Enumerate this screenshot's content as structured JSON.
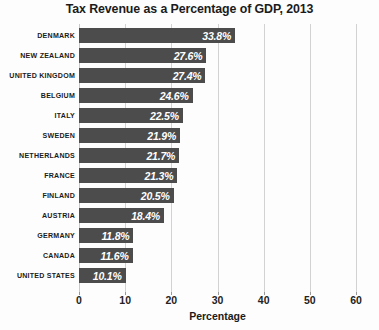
{
  "chart_data": {
    "type": "bar",
    "orientation": "horizontal",
    "title": "Tax Revenue as a Percentage of GDP, 2013",
    "xlabel": "Percentage",
    "ylabel": "",
    "categories": [
      "DENMARK",
      "NEW ZEALAND",
      "UNITED KINGDOM",
      "BELGIUM",
      "ITALY",
      "SWEDEN",
      "NETHERLANDS",
      "FRANCE",
      "FINLAND",
      "AUSTRIA",
      "GERMANY",
      "CANADA",
      "UNITED STATES"
    ],
    "values": [
      33.8,
      27.6,
      27.4,
      24.6,
      22.5,
      21.9,
      21.7,
      21.3,
      20.5,
      18.4,
      11.8,
      11.6,
      10.1
    ],
    "value_labels": [
      "33.8%",
      "27.6%",
      "27.4%",
      "24.6%",
      "22.5%",
      "21.9%",
      "21.7%",
      "21.3%",
      "20.5%",
      "18.4%",
      "11.8%",
      "11.6%",
      "10.1%"
    ],
    "xlim": [
      0,
      60
    ],
    "xticks": [
      0,
      10,
      20,
      30,
      40,
      50,
      60
    ],
    "xtick_labels": [
      "0",
      "10",
      "20",
      "30",
      "40",
      "50",
      "60"
    ],
    "grid": true,
    "grid_axis": "x",
    "legend": false,
    "bar_color": "#4c4c4c",
    "value_label_color": "#ffffff",
    "gridline_color": "#d2d2d2",
    "text_color": "#1b1b1b",
    "background_color": "#fdfdfd"
  }
}
